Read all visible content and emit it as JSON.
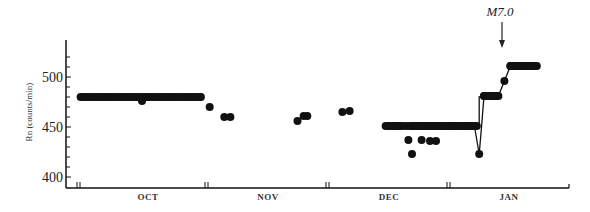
{
  "chart_data": {
    "type": "scatter",
    "title": "",
    "xlabel": "",
    "ylabel": "Rn (counts/min)",
    "ylim": [
      400,
      530
    ],
    "yticks": [
      400,
      450,
      500
    ],
    "ytick_labels": [
      "400",
      "450",
      "500"
    ],
    "grid": false,
    "legend": null,
    "x_categories": [
      "OCT",
      "NOV",
      "DEC",
      "JAN"
    ],
    "annotation": {
      "text": "M7.0",
      "position_month": "JAN",
      "marker": "down-arrow"
    },
    "series": [
      {
        "name": "OCT",
        "points": [
          {
            "x": 0.05,
            "y": 480
          },
          {
            "x": 0.15,
            "y": 480
          },
          {
            "x": 0.25,
            "y": 480
          },
          {
            "x": 0.35,
            "y": 480
          },
          {
            "x": 0.45,
            "y": 480
          },
          {
            "x": 0.5,
            "y": 476
          },
          {
            "x": 0.55,
            "y": 480
          },
          {
            "x": 0.65,
            "y": 480
          },
          {
            "x": 0.75,
            "y": 480
          },
          {
            "x": 0.85,
            "y": 480
          },
          {
            "x": 0.95,
            "y": 480
          }
        ]
      },
      {
        "name": "NOV",
        "points": [
          {
            "x": 1.03,
            "y": 470
          },
          {
            "x": 1.15,
            "y": 460
          },
          {
            "x": 1.2,
            "y": 460
          },
          {
            "x": 1.75,
            "y": 456
          },
          {
            "x": 1.8,
            "y": 461
          },
          {
            "x": 1.83,
            "y": 461
          },
          {
            "x": 2.12,
            "y": 465
          },
          {
            "x": 2.18,
            "y": 466
          }
        ]
      },
      {
        "name": "DEC",
        "points": [
          {
            "x": 2.5,
            "y": 451
          },
          {
            "x": 2.55,
            "y": 451
          },
          {
            "x": 2.6,
            "y": 451
          },
          {
            "x": 2.65,
            "y": 451
          },
          {
            "x": 2.72,
            "y": 451
          },
          {
            "x": 2.78,
            "y": 451
          },
          {
            "x": 2.85,
            "y": 451
          },
          {
            "x": 2.92,
            "y": 451
          },
          {
            "x": 3.0,
            "y": 451
          },
          {
            "x": 3.05,
            "y": 451
          },
          {
            "x": 3.1,
            "y": 451
          },
          {
            "x": 3.15,
            "y": 451
          },
          {
            "x": 3.2,
            "y": 451
          },
          {
            "x": 2.67,
            "y": 437
          },
          {
            "x": 2.78,
            "y": 437
          },
          {
            "x": 2.85,
            "y": 436
          },
          {
            "x": 2.9,
            "y": 436
          },
          {
            "x": 2.7,
            "y": 423
          }
        ]
      },
      {
        "name": "JAN",
        "points": [
          {
            "x": 3.26,
            "y": 423
          },
          {
            "x": 3.3,
            "y": 481
          },
          {
            "x": 3.35,
            "y": 481
          },
          {
            "x": 3.4,
            "y": 481
          },
          {
            "x": 3.47,
            "y": 496
          },
          {
            "x": 3.52,
            "y": 511
          },
          {
            "x": 3.58,
            "y": 511
          },
          {
            "x": 3.65,
            "y": 511
          },
          {
            "x": 3.72,
            "y": 511
          }
        ]
      }
    ]
  }
}
